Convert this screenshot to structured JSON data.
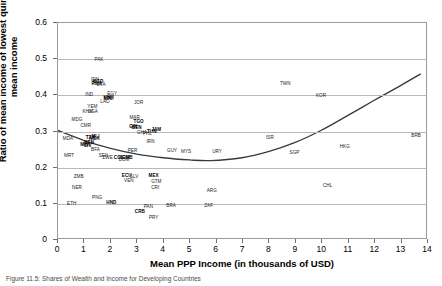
{
  "figure": {
    "caption": "Figure 11.5: Shares of Wealth and Income for Developing Countries"
  },
  "chart_data": {
    "type": "scatter",
    "title": "",
    "xlabel": "Mean PPP Income (in thousands of USD)",
    "ylabel": "Ratio of mean income of lowest quintile to mean income",
    "xlim": [
      0,
      14
    ],
    "ylim": [
      0,
      0.6
    ],
    "xticks": [
      "0",
      "1",
      "2",
      "3",
      "4",
      "5",
      "6",
      "7",
      "8",
      "9",
      "10",
      "11",
      "12",
      "13",
      "14"
    ],
    "yticks": [
      "0",
      "0.1",
      "0.2",
      "0.3",
      "0.4",
      "0.5",
      "0.6"
    ],
    "grid": "horizontal",
    "legend": "none",
    "point_label_type": "country-code",
    "points": [
      {
        "label": "PAK",
        "x": 1.55,
        "y": 0.497
      },
      {
        "label": "IDN",
        "x": 1.4,
        "y": 0.443
      },
      {
        "label": "BGD",
        "x": 1.52,
        "y": 0.437
      },
      {
        "label": "RWA",
        "x": 1.47,
        "y": 0.432
      },
      {
        "label": "LKA",
        "x": 1.63,
        "y": 0.428
      },
      {
        "label": "IND",
        "x": 1.18,
        "y": 0.402
      },
      {
        "label": "EGY",
        "x": 2.05,
        "y": 0.403
      },
      {
        "label": "VNM",
        "x": 1.92,
        "y": 0.394
      },
      {
        "label": "NPL",
        "x": 1.9,
        "y": 0.39
      },
      {
        "label": "LAO",
        "x": 1.78,
        "y": 0.382
      },
      {
        "label": "JOR",
        "x": 3.05,
        "y": 0.378
      },
      {
        "label": "YEM",
        "x": 1.3,
        "y": 0.368
      },
      {
        "label": "KHM",
        "x": 1.12,
        "y": 0.355
      },
      {
        "label": "UGA",
        "x": 1.32,
        "y": 0.353
      },
      {
        "label": "MDG",
        "x": 0.72,
        "y": 0.331
      },
      {
        "label": "MAR",
        "x": 2.9,
        "y": 0.336
      },
      {
        "label": "TGO",
        "x": 3.05,
        "y": 0.327
      },
      {
        "label": "CMR",
        "x": 1.05,
        "y": 0.316
      },
      {
        "label": "GIN",
        "x": 2.85,
        "y": 0.312
      },
      {
        "label": "BEN",
        "x": 2.98,
        "y": 0.311
      },
      {
        "label": "JAM",
        "x": 3.72,
        "y": 0.303
      },
      {
        "label": "GHA",
        "x": 3.18,
        "y": 0.297
      },
      {
        "label": "PHL",
        "x": 3.38,
        "y": 0.293
      },
      {
        "label": "TUN",
        "x": 3.55,
        "y": 0.3
      },
      {
        "label": "MLI",
        "x": 1.42,
        "y": 0.286
      },
      {
        "label": "TZA",
        "x": 1.22,
        "y": 0.283
      },
      {
        "label": "NGA",
        "x": 1.38,
        "y": 0.28
      },
      {
        "label": "IRN",
        "x": 3.5,
        "y": 0.271
      },
      {
        "label": "KEN",
        "x": 1.18,
        "y": 0.268
      },
      {
        "label": "MWI",
        "x": 1.02,
        "y": 0.262
      },
      {
        "label": "CIV",
        "x": 1.12,
        "y": 0.259
      },
      {
        "label": "BFA",
        "x": 1.42,
        "y": 0.249
      },
      {
        "label": "PER",
        "x": 2.82,
        "y": 0.246
      },
      {
        "label": "GUY",
        "x": 4.32,
        "y": 0.247
      },
      {
        "label": "MYS",
        "x": 4.85,
        "y": 0.243
      },
      {
        "label": "URY",
        "x": 6.02,
        "y": 0.243
      },
      {
        "label": "ISR",
        "x": 8.02,
        "y": 0.282
      },
      {
        "label": "TWN",
        "x": 8.6,
        "y": 0.43
      },
      {
        "label": "KOR",
        "x": 9.95,
        "y": 0.398
      },
      {
        "label": "SGP",
        "x": 8.95,
        "y": 0.24
      },
      {
        "label": "HKG",
        "x": 10.85,
        "y": 0.258
      },
      {
        "label": "BRB",
        "x": 13.55,
        "y": 0.288
      },
      {
        "label": "MDA",
        "x": 0.38,
        "y": 0.28
      },
      {
        "label": "SEN",
        "x": 1.72,
        "y": 0.232
      },
      {
        "label": "ZWE",
        "x": 1.88,
        "y": 0.228
      },
      {
        "label": "COL",
        "x": 2.3,
        "y": 0.228
      },
      {
        "label": "DOM",
        "x": 2.52,
        "y": 0.226
      },
      {
        "label": "GMB",
        "x": 2.62,
        "y": 0.226
      },
      {
        "label": "MRT",
        "x": 0.42,
        "y": 0.232
      },
      {
        "label": "ZMB",
        "x": 0.78,
        "y": 0.173
      },
      {
        "label": "ECU",
        "x": 2.6,
        "y": 0.177
      },
      {
        "label": "SLV",
        "x": 2.88,
        "y": 0.173
      },
      {
        "label": "MEX",
        "x": 3.62,
        "y": 0.177
      },
      {
        "label": "VEN",
        "x": 2.68,
        "y": 0.163
      },
      {
        "label": "GTM",
        "x": 3.72,
        "y": 0.16
      },
      {
        "label": "NER",
        "x": 0.72,
        "y": 0.145
      },
      {
        "label": "CRI",
        "x": 3.68,
        "y": 0.145
      },
      {
        "label": "CHL",
        "x": 10.2,
        "y": 0.148
      },
      {
        "label": "ARG",
        "x": 5.82,
        "y": 0.135
      },
      {
        "label": "PNG",
        "x": 1.48,
        "y": 0.115
      },
      {
        "label": "ETH",
        "x": 0.52,
        "y": 0.1
      },
      {
        "label": "HND",
        "x": 2.02,
        "y": 0.102
      },
      {
        "label": "PAN",
        "x": 3.42,
        "y": 0.09
      },
      {
        "label": "BRA",
        "x": 4.28,
        "y": 0.093
      },
      {
        "label": "ZAF",
        "x": 5.7,
        "y": 0.095
      },
      {
        "label": "CRB",
        "x": 3.1,
        "y": 0.078
      },
      {
        "label": "PRY",
        "x": 3.62,
        "y": 0.062
      },
      {
        "label": "DOM2",
        "x": 2.5,
        "y": 0.222
      }
    ],
    "bold_labels": [
      "BGD",
      "RWA",
      "NPL",
      "VNM",
      "TGO",
      "GIN",
      "BEN",
      "TUN",
      "MLI",
      "TZA",
      "NGA",
      "KEN",
      "MWI",
      "CIV",
      "GMB",
      "COL",
      "MEX",
      "ECU",
      "HND",
      "CRB",
      "JAM"
    ],
    "trend_line": {
      "name": "fitted quadratic trend",
      "points": [
        {
          "x": 0.0,
          "y": 0.3
        },
        {
          "x": 1.0,
          "y": 0.272
        },
        {
          "x": 2.0,
          "y": 0.25
        },
        {
          "x": 3.0,
          "y": 0.234
        },
        {
          "x": 4.0,
          "y": 0.224
        },
        {
          "x": 5.0,
          "y": 0.218
        },
        {
          "x": 5.8,
          "y": 0.216
        },
        {
          "x": 7.0,
          "y": 0.224
        },
        {
          "x": 8.0,
          "y": 0.241
        },
        {
          "x": 9.0,
          "y": 0.266
        },
        {
          "x": 10.0,
          "y": 0.3
        },
        {
          "x": 11.0,
          "y": 0.341
        },
        {
          "x": 12.0,
          "y": 0.383
        },
        {
          "x": 13.0,
          "y": 0.424
        },
        {
          "x": 13.8,
          "y": 0.458
        }
      ]
    }
  }
}
